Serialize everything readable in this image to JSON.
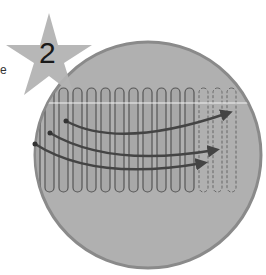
{
  "figure": {
    "step_badge": {
      "number": "2",
      "shape": "star",
      "color": "#b3b3b3"
    },
    "edge_letter": "e",
    "circle": {
      "fill": "#b0b0b0",
      "stroke": "#8a8a8a",
      "cx": 148,
      "cy": 155,
      "r": 113
    },
    "grid": {
      "solid_columns": 14,
      "dashed_columns": 4,
      "line_color": "#555555",
      "column_fill": "#a8a8a8",
      "top": 88,
      "bottom": 193,
      "highlight_line_color": "#f2f2f2"
    },
    "arrows": [
      {
        "name": "arrow-upper",
        "start": [
          66,
          121
        ],
        "end": [
          230,
          112
        ]
      },
      {
        "name": "arrow-middle",
        "start": [
          50,
          133
        ],
        "end": [
          218,
          150
        ]
      },
      {
        "name": "arrow-lower",
        "start": [
          35,
          144
        ],
        "end": [
          206,
          163
        ]
      }
    ],
    "arrow_color": "#444444"
  }
}
